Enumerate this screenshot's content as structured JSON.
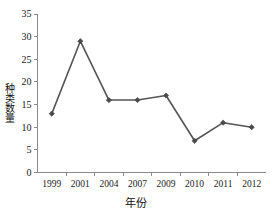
{
  "chart_data": {
    "type": "line",
    "title": "",
    "subtitle": "",
    "xlabel": "年份",
    "ylabel": "种类数量",
    "categories": [
      "1999",
      "2001",
      "2004",
      "2007",
      "2009",
      "2010",
      "2011",
      "2012"
    ],
    "values": [
      13,
      29,
      16,
      16,
      17,
      7,
      11,
      10
    ],
    "series": [
      {
        "name": "种类数量",
        "values": [
          13,
          29,
          16,
          16,
          17,
          7,
          11,
          10
        ]
      }
    ],
    "ylim": [
      0,
      35
    ],
    "ytick_labels": [
      "0",
      "5",
      "10",
      "15",
      "20",
      "25",
      "30",
      "35"
    ],
    "ytick_values": [
      0,
      5,
      10,
      15,
      20,
      25,
      30,
      35
    ],
    "xtick_labels": [
      "1999",
      "2001",
      "2004",
      "2007",
      "2009",
      "2010",
      "2011",
      "2012"
    ],
    "grid": false,
    "legend": false,
    "legend_position": "none",
    "marker": "diamond",
    "line_color": "#555555",
    "marker_color": "#4a4a4a",
    "axis_color": "#8a8a8a",
    "background_color": "#ffffff",
    "annotations": []
  },
  "axis": {
    "y_title": "种类数量",
    "x_title": "年份"
  }
}
